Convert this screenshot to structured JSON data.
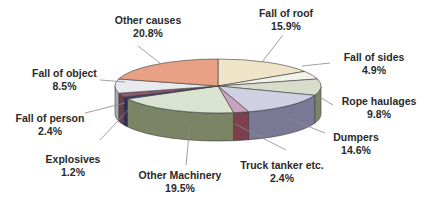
{
  "chart_data": {
    "type": "pie",
    "style": "3d-exploded-none",
    "title": "",
    "slices": [
      {
        "label": "Fall of roof",
        "value": 15.9,
        "display": "15.9%",
        "color": "#efe3c8"
      },
      {
        "label": "Fall of sides",
        "value": 4.9,
        "display": "4.9%",
        "color": "#f4f1ea"
      },
      {
        "label": "Rope haulages",
        "value": 9.8,
        "display": "9.8%",
        "color": "#d8dccb"
      },
      {
        "label": "Dumpers",
        "value": 14.6,
        "display": "14.6%",
        "color": "#cfd0e2"
      },
      {
        "label": "Truck tanker etc.",
        "value": 2.4,
        "display": "2.4%",
        "color": "#c7a3bd"
      },
      {
        "label": "Other Machinery",
        "value": 19.5,
        "display": "19.5%",
        "color": "#d9e3d0"
      },
      {
        "label": "Explosives",
        "value": 1.2,
        "display": "1.2%",
        "color": "#3b3f7a"
      },
      {
        "label": "Fall of person",
        "value": 2.4,
        "display": "2.4%",
        "color": "#8e5a6c"
      },
      {
        "label": "Fall of object",
        "value": 8.5,
        "display": "8.5%",
        "color": "#e9eaf0"
      },
      {
        "label": "Other causes",
        "value": 20.8,
        "display": "20.8%",
        "color": "#e8a185"
      }
    ],
    "side_colors": {
      "Fall of roof": "#b9a98a",
      "Fall of sides": "#b8b3a8",
      "Rope haulages": "#7f8468",
      "Dumpers": "#7b7896",
      "Truck tanker etc.": "#7e3f4c",
      "Other Machinery": "#7b8464",
      "Explosives": "#2b2d60",
      "Fall of person": "#6c3e4e",
      "Fall of object": "#a9aab6",
      "Other causes": "#b26a55"
    },
    "legend": "none",
    "labels_position": "outside-with-leader-lines"
  }
}
